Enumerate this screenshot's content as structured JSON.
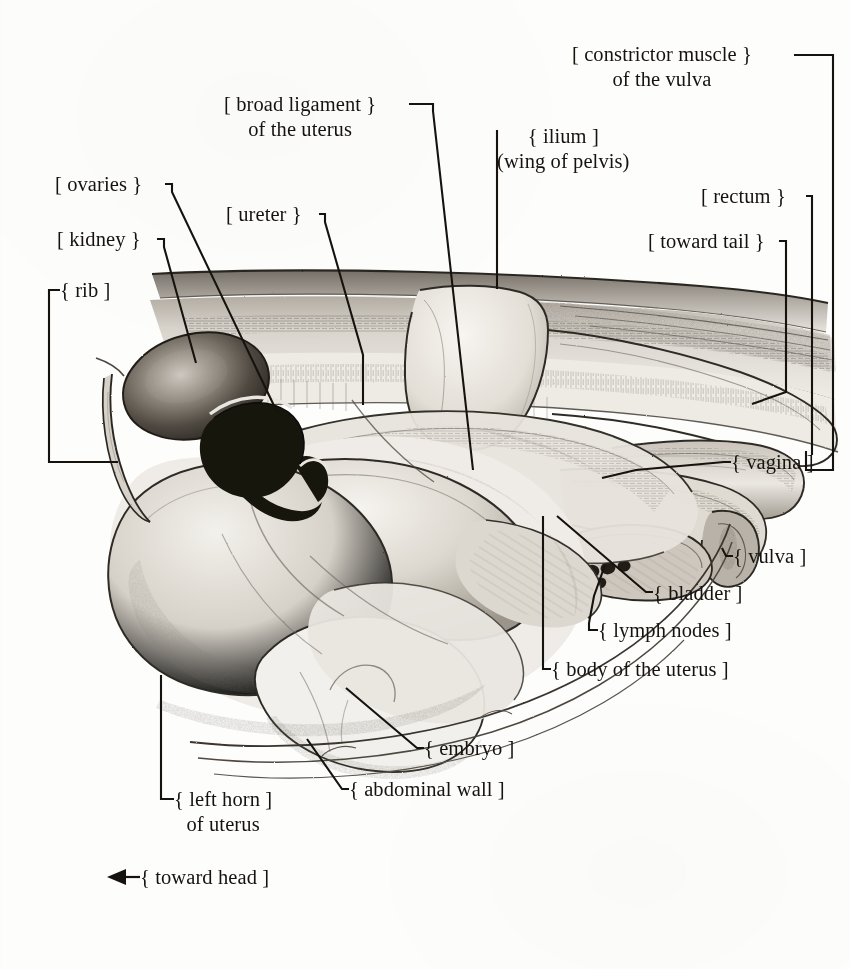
{
  "figure": {
    "medium": "pencil drawing",
    "background_color": "#fdfdfc",
    "ink_color": "#16130f"
  },
  "labels": [
    {
      "id": "constrictor-muscle-of-the-vulva",
      "line1": "[ constrictor muscle }",
      "line2": "of the vulva",
      "text": "constrictor muscle of the vulva",
      "x": 572,
      "y": 42,
      "bracket": "right",
      "lines": 2
    },
    {
      "id": "broad-ligament-of-the-uterus",
      "line1": "[ broad ligament }",
      "line2": "of the uterus",
      "text": "broad ligament of the uterus",
      "x": 224,
      "y": 92,
      "bracket": "right",
      "lines": 2
    },
    {
      "id": "ilium",
      "line1": "{ ilium ]",
      "line2": "(wing of pelvis)",
      "text": "ilium (wing of pelvis)",
      "x": 497,
      "y": 124,
      "bracket": "left",
      "lines": 2
    },
    {
      "id": "ovaries",
      "line1": "[ ovaries }",
      "text": "ovaries",
      "x": 55,
      "y": 172,
      "bracket": "right",
      "lines": 1
    },
    {
      "id": "rectum",
      "line1": "[ rectum }",
      "text": "rectum",
      "x": 701,
      "y": 184,
      "bracket": "right",
      "lines": 1
    },
    {
      "id": "ureter",
      "line1": "[ ureter }",
      "text": "ureter",
      "x": 226,
      "y": 202,
      "bracket": "right",
      "lines": 1
    },
    {
      "id": "kidney",
      "line1": "[ kidney }",
      "text": "kidney",
      "x": 57,
      "y": 227,
      "bracket": "right",
      "lines": 1
    },
    {
      "id": "toward-tail",
      "line1": "[ toward tail }",
      "text": "toward tail",
      "x": 648,
      "y": 229,
      "bracket": "right",
      "lines": 1
    },
    {
      "id": "rib",
      "line1": "{ rib ]",
      "text": "rib",
      "x": 60,
      "y": 278,
      "bracket": "left",
      "lines": 1
    },
    {
      "id": "vagina",
      "line1": "{ vagina ]",
      "text": "vagina",
      "x": 731,
      "y": 450,
      "bracket": "left",
      "lines": 1
    },
    {
      "id": "vulva",
      "line1": "{ vulva ]",
      "text": "vulva",
      "x": 733,
      "y": 544,
      "bracket": "left",
      "lines": 1
    },
    {
      "id": "bladder",
      "line1": "{ bladder ]",
      "text": "bladder",
      "x": 653,
      "y": 581,
      "bracket": "left",
      "lines": 1
    },
    {
      "id": "lymph-nodes",
      "line1": "{ lymph nodes ]",
      "text": "lymph nodes",
      "x": 598,
      "y": 618,
      "bracket": "left",
      "lines": 1
    },
    {
      "id": "body-of-the-uterus",
      "line1": "{ body of the uterus ]",
      "text": "body of the uterus",
      "x": 551,
      "y": 657,
      "bracket": "left",
      "lines": 1
    },
    {
      "id": "embryo",
      "line1": "{ embryo ]",
      "text": "embryo",
      "x": 424,
      "y": 736,
      "bracket": "left",
      "lines": 1
    },
    {
      "id": "abdominal-wall",
      "line1": "{ abdominal wall ]",
      "text": "abdominal wall",
      "x": 349,
      "y": 777,
      "bracket": "left",
      "lines": 1
    },
    {
      "id": "left-horn-of-uterus",
      "line1": "{ left horn ]",
      "line2": "of uterus",
      "text": "left horn of uterus",
      "x": 174,
      "y": 787,
      "bracket": "left",
      "lines": 2
    },
    {
      "id": "toward-head",
      "line1": "{ toward head ]",
      "text": "toward head",
      "x": 140,
      "y": 865,
      "bracket": "left",
      "lines": 1,
      "arrow": "left"
    }
  ],
  "leader_lines": [
    {
      "for": "constrictor-muscle-of-the-vulva",
      "path": "M794,55 L833,55 L833,470 L806,470 L806,451"
    },
    {
      "for": "broad-ligament-of-the-uterus",
      "path": "M409,104 L433,104 L433,111 L473,470"
    },
    {
      "for": "ilium",
      "path": "M497,136 L497,130 L497,289"
    },
    {
      "for": "ovaries",
      "path": "M165,184 L172,184 L172,192 L278,414"
    },
    {
      "for": "rectum",
      "path": "M806,196 L812,196 L812,204 L812,455"
    },
    {
      "for": "ureter",
      "path": "M319,214 L325,214 L325,222 L363,355 L363,405"
    },
    {
      "for": "kidney",
      "path": "M157,239 L164,239 L164,247 L196,363"
    },
    {
      "for": "toward-tail",
      "path": "M779,241 L786,241 L786,250 L786,392 L752,404"
    },
    {
      "for": "rib",
      "path": "M60,290 L49,290 L49,462 L118,462"
    },
    {
      "for": "vagina",
      "path": "M731,462 L724,462 L636,470 L602,478"
    },
    {
      "for": "vulva",
      "path": "M733,556 L726,556 L722,548"
    },
    {
      "for": "bladder",
      "path": "M653,592 L646,592 L557,516"
    },
    {
      "for": "lymph-nodes",
      "path": "M598,630 L589,630 L589,623 L594,596 L605,565"
    },
    {
      "for": "body-of-the-uterus",
      "path": "M551,669 L543,669 L543,516"
    },
    {
      "for": "embryo",
      "path": "M424,748 L417,748 L346,688"
    },
    {
      "for": "abdominal-wall",
      "path": "M349,789 L342,789 L307,739"
    },
    {
      "for": "left-horn-of-uterus",
      "path": "M174,799 L161,799 L161,675"
    },
    {
      "for": "toward-head",
      "path": "M140,877 L112,877"
    }
  ],
  "arrow": {
    "for": "toward-head",
    "tip_x": 107,
    "tip_y": 877,
    "direction": "left"
  }
}
